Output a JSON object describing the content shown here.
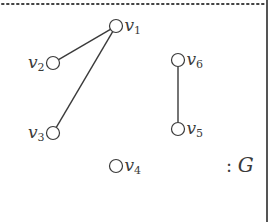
{
  "graph": {
    "name": "G",
    "caption": ": G",
    "colors": {
      "stroke": "#3a3a3a",
      "frame": "#555555",
      "dots": "#444444",
      "background": "#ffffff"
    },
    "vertices": [
      {
        "id": "v1",
        "label": "v",
        "sub": "1",
        "x": 116,
        "y": 26,
        "label_side": "right"
      },
      {
        "id": "v2",
        "label": "v",
        "sub": "2",
        "x": 53,
        "y": 63,
        "label_side": "left"
      },
      {
        "id": "v3",
        "label": "v",
        "sub": "3",
        "x": 53,
        "y": 133,
        "label_side": "left"
      },
      {
        "id": "v4",
        "label": "v",
        "sub": "4",
        "x": 116,
        "y": 166,
        "label_side": "right"
      },
      {
        "id": "v5",
        "label": "v",
        "sub": "5",
        "x": 178,
        "y": 129,
        "label_side": "right"
      },
      {
        "id": "v6",
        "label": "v",
        "sub": "6",
        "x": 178,
        "y": 60,
        "label_side": "right"
      }
    ],
    "edges": [
      {
        "from": "v1",
        "to": "v2"
      },
      {
        "from": "v1",
        "to": "v3"
      },
      {
        "from": "v6",
        "to": "v5"
      }
    ]
  }
}
